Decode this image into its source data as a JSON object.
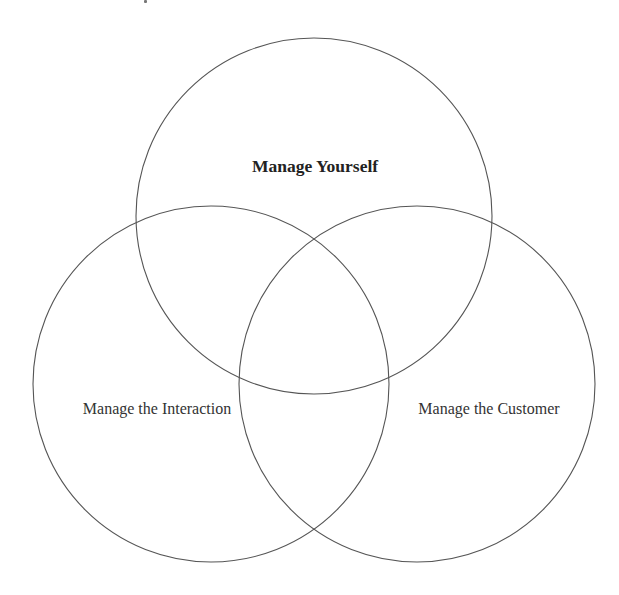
{
  "diagram": {
    "type": "venn-3",
    "stroke_color": "#555555",
    "background": "#ffffff",
    "circles": [
      {
        "id": "manage-yourself",
        "label": "Manage Yourself",
        "cx": 314,
        "cy": 216,
        "r": 178,
        "bold": true,
        "label_x": 315,
        "label_y": 166
      },
      {
        "id": "manage-the-interaction",
        "label": "Manage the Interaction",
        "cx": 211,
        "cy": 384,
        "r": 178,
        "bold": false,
        "label_x": 157,
        "label_y": 409
      },
      {
        "id": "manage-the-customer",
        "label": "Manage the Customer",
        "cx": 417,
        "cy": 384,
        "r": 178,
        "bold": false,
        "label_x": 489,
        "label_y": 409
      }
    ]
  }
}
